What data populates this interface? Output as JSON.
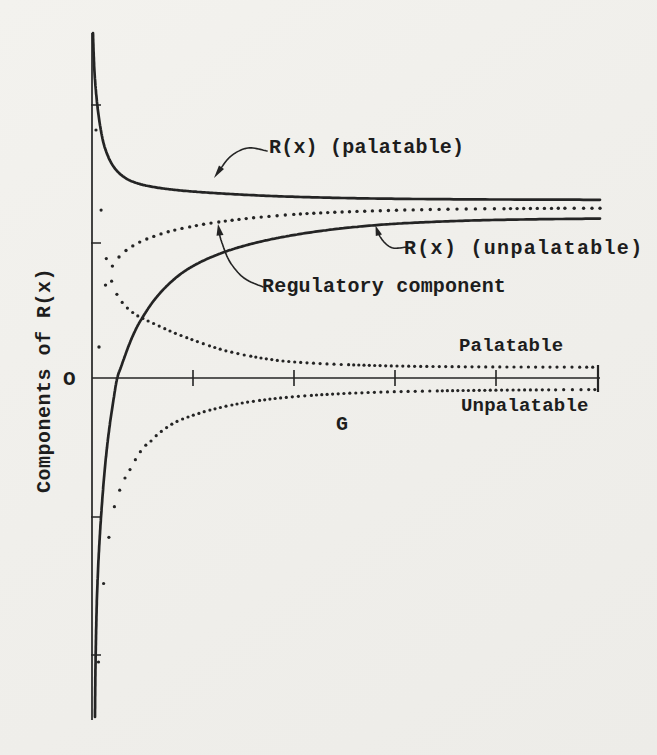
{
  "figure": {
    "width": 657,
    "height": 755,
    "paper_color": "#f0efeb",
    "ink_color": "#242424"
  },
  "labels": {
    "y_axis": "Components of R(x)",
    "origin": "O",
    "g": "G",
    "rx_palatable": "R(x) (palatable)",
    "rx_unpalatable": "R(x) (unpalatable)",
    "regulatory": "Regulatory component",
    "palatable": "Palatable",
    "unpalatable": "Unpalatable"
  },
  "chart_data": {
    "type": "line",
    "xlabel": "G",
    "ylabel": "Components of R(x)",
    "grid": false,
    "legend_position": "inline-annotations",
    "axes": {
      "origin": [
        92,
        378
      ],
      "x_end": 600,
      "y_top": 33,
      "y_bottom": 720,
      "x_ticks": [
        193,
        294,
        395,
        496
      ],
      "x_tick_half": 8,
      "end_bar": {
        "x": 598,
        "y1": 365,
        "y2": 392
      },
      "y_ticks": [
        105,
        243,
        517,
        655
      ],
      "y_tick_len": 9,
      "axis_width": 1.7
    },
    "series": [
      {
        "id": "rx-palatable",
        "name": "R(x) (palatable)",
        "style": "solid",
        "width": 2.7,
        "points": [
          [
            93,
            33
          ],
          [
            93.6,
            52
          ],
          [
            94.5,
            72
          ],
          [
            96,
            92
          ],
          [
            98,
            111
          ],
          [
            100.5,
            128
          ],
          [
            103.5,
            143
          ],
          [
            107.5,
            155
          ],
          [
            112.5,
            165
          ],
          [
            119,
            173
          ],
          [
            127,
            179
          ],
          [
            136.5,
            183
          ],
          [
            148,
            186
          ],
          [
            162,
            188.3
          ],
          [
            179,
            190.3
          ],
          [
            199,
            192
          ],
          [
            222,
            193.5
          ],
          [
            249,
            195
          ],
          [
            279,
            196.3
          ],
          [
            312,
            197.3
          ],
          [
            348,
            198.1
          ],
          [
            388,
            198.7
          ],
          [
            431,
            199.1
          ],
          [
            477,
            199.4
          ],
          [
            526,
            199.6
          ],
          [
            562,
            199.7
          ],
          [
            600,
            199.8
          ]
        ]
      },
      {
        "id": "rx-unpalatable",
        "name": "R(x) (unpalatable)",
        "style": "solid",
        "width": 2.7,
        "points": [
          [
            95,
            717
          ],
          [
            95.2,
            690
          ],
          [
            95.6,
            660
          ],
          [
            96.2,
            628
          ],
          [
            97,
            596
          ],
          [
            98.2,
            566
          ],
          [
            99.8,
            536
          ],
          [
            101.8,
            506
          ],
          [
            104,
            478
          ],
          [
            106.5,
            452
          ],
          [
            109.5,
            427
          ],
          [
            113,
            403
          ],
          [
            117,
            379
          ],
          [
            121,
            367
          ],
          [
            126,
            353
          ],
          [
            131,
            340
          ],
          [
            137,
            327
          ],
          [
            144,
            315
          ],
          [
            152,
            303
          ],
          [
            161,
            292
          ],
          [
            171,
            282
          ],
          [
            182,
            273
          ],
          [
            194,
            265.5
          ],
          [
            208,
            258.5
          ],
          [
            223,
            252.5
          ],
          [
            240,
            247
          ],
          [
            259,
            242
          ],
          [
            280,
            237.5
          ],
          [
            303,
            233.5
          ],
          [
            328,
            230
          ],
          [
            355,
            227
          ],
          [
            384,
            224.5
          ],
          [
            415,
            222.7
          ],
          [
            448,
            221.3
          ],
          [
            483,
            220.2
          ],
          [
            520,
            219.5
          ],
          [
            559,
            219
          ],
          [
            600,
            218.6
          ]
        ]
      },
      {
        "id": "regulatory-component",
        "name": "Regulatory component",
        "style": "dotted",
        "dot_dx": 6.5,
        "dot_r": 1.7,
        "points": [
          [
            99,
            347
          ],
          [
            100,
            331
          ],
          [
            101.5,
            314
          ],
          [
            103.5,
            297
          ],
          [
            106,
            283
          ],
          [
            109.5,
            272
          ],
          [
            114,
            263.5
          ],
          [
            119.5,
            256.5
          ],
          [
            126,
            250.5
          ],
          [
            133.5,
            245.5
          ],
          [
            142,
            241
          ],
          [
            152,
            237
          ],
          [
            163,
            233.3
          ],
          [
            176,
            229.8
          ],
          [
            191,
            226.6
          ],
          [
            208,
            223.6
          ],
          [
            227,
            220.9
          ],
          [
            248,
            218.4
          ],
          [
            271,
            216.2
          ],
          [
            296,
            214.3
          ],
          [
            323,
            212.8
          ],
          [
            352,
            211.6
          ],
          [
            383,
            210.6
          ],
          [
            416,
            209.8
          ],
          [
            451,
            209.2
          ],
          [
            488,
            208.8
          ],
          [
            527,
            208.5
          ],
          [
            568,
            208.3
          ],
          [
            600,
            208.2
          ]
        ]
      },
      {
        "id": "attack-palatable",
        "name": "Palatable",
        "style": "dotted",
        "dot_dx": 5,
        "dot_r": 1.6,
        "points": [
          [
            96,
            130
          ],
          [
            97,
            150
          ],
          [
            98.3,
            172
          ],
          [
            100,
            196
          ],
          [
            102,
            220
          ],
          [
            104.3,
            243
          ],
          [
            107,
            263
          ],
          [
            110,
            276
          ],
          [
            114,
            288
          ],
          [
            118.5,
            297
          ],
          [
            123.5,
            304
          ],
          [
            129.5,
            310
          ],
          [
            136,
            314.8
          ],
          [
            143.5,
            318.8
          ],
          [
            151.5,
            322.5
          ],
          [
            160,
            326.5
          ],
          [
            170,
            331
          ],
          [
            181,
            335.5
          ],
          [
            193,
            340
          ],
          [
            207,
            345
          ],
          [
            223,
            350
          ],
          [
            241,
            354.3
          ],
          [
            261,
            358
          ],
          [
            283,
            361
          ],
          [
            307,
            362.8
          ],
          [
            334,
            364.2
          ],
          [
            364,
            365.2
          ],
          [
            397,
            366
          ],
          [
            433,
            366.5
          ],
          [
            472,
            366.8
          ],
          [
            514,
            367
          ],
          [
            557,
            367.1
          ],
          [
            597,
            367.2
          ]
        ]
      },
      {
        "id": "attack-unpalatable",
        "name": "Unpalatable",
        "style": "dotted",
        "dot_dx": 5,
        "dot_r": 1.6,
        "points": [
          [
            98.5,
            662
          ],
          [
            100,
            625
          ],
          [
            101.7,
            598
          ],
          [
            104,
            580
          ],
          [
            107,
            552
          ],
          [
            112,
            517
          ],
          [
            118,
            495
          ],
          [
            125,
            478
          ],
          [
            131,
            468
          ],
          [
            137,
            457
          ],
          [
            144,
            447
          ],
          [
            151,
            441
          ],
          [
            158,
            434
          ],
          [
            166,
            428
          ],
          [
            173,
            423.5
          ],
          [
            180,
            420
          ],
          [
            188,
            417
          ],
          [
            196,
            414.3
          ],
          [
            205,
            411.5
          ],
          [
            215,
            408.8
          ],
          [
            226,
            406.2
          ],
          [
            238,
            403.8
          ],
          [
            251,
            401.6
          ],
          [
            266,
            399.6
          ],
          [
            282,
            397.8
          ],
          [
            300,
            396.2
          ],
          [
            320,
            394.8
          ],
          [
            342,
            393.6
          ],
          [
            366,
            392.6
          ],
          [
            392,
            391.8
          ],
          [
            420,
            391.2
          ],
          [
            450,
            390.7
          ],
          [
            482,
            390.3
          ],
          [
            516,
            390
          ],
          [
            552,
            389.8
          ],
          [
            597,
            389.6
          ]
        ]
      }
    ]
  },
  "annotations": [
    {
      "id": "arrow-rx-palatable",
      "path": [
        [
          267,
          151
        ],
        [
          248,
          148
        ],
        [
          231,
          156
        ],
        [
          219,
          171
        ]
      ],
      "head": [
        [
          214,
          178
        ],
        [
          224,
          169
        ],
        [
          219,
          165.5
        ]
      ]
    },
    {
      "id": "arrow-regulatory",
      "path": [
        [
          263,
          287
        ],
        [
          244,
          278
        ],
        [
          230,
          262
        ],
        [
          222,
          243
        ],
        [
          219,
          232
        ]
      ],
      "head": [
        [
          218,
          224
        ],
        [
          223.5,
          235
        ],
        [
          216.5,
          235.8
        ]
      ]
    },
    {
      "id": "arrow-rx-unpalatable",
      "path": [
        [
          407,
          247
        ],
        [
          393,
          248
        ],
        [
          384,
          242
        ],
        [
          378,
          233
        ]
      ],
      "head": [
        [
          375.5,
          225.5
        ],
        [
          382,
          234.5
        ],
        [
          375.8,
          236
        ]
      ]
    }
  ]
}
